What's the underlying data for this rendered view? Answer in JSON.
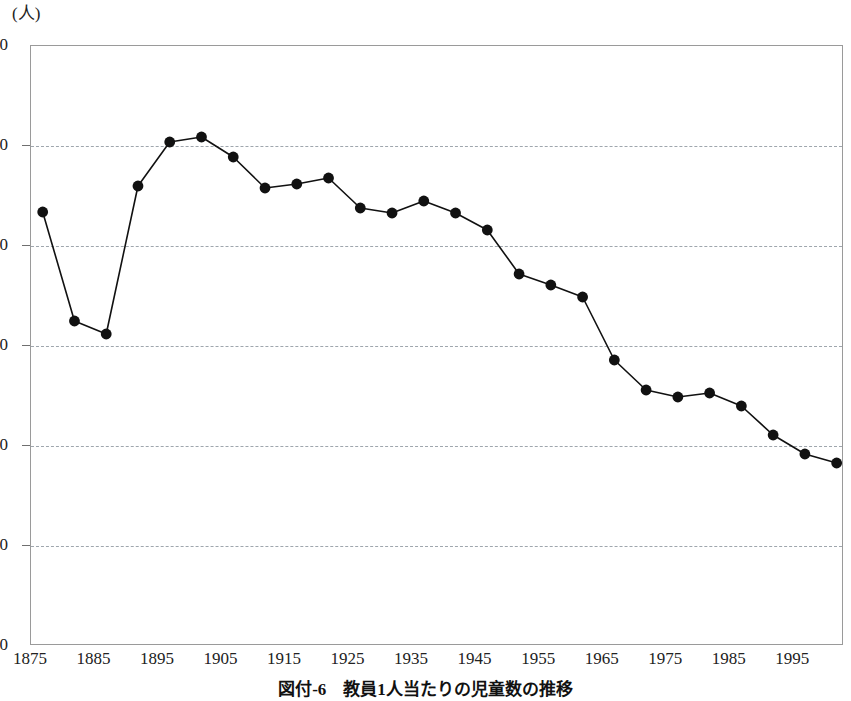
{
  "figure": {
    "caption": "図付-6　教員1人当たりの児童数の推移",
    "unit_label": "(人)"
  },
  "chart_data": {
    "type": "line",
    "title": "図付-6　教員1人当たりの児童数の推移",
    "xlabel": "",
    "ylabel": "(人)",
    "unit": "人",
    "xlim": [
      1875,
      2003
    ],
    "ylim": [
      0,
      60
    ],
    "yticks": [
      0,
      10,
      20,
      30,
      40,
      50,
      60
    ],
    "ytick_labels": [
      "0",
      "10",
      "20",
      "30",
      "40",
      "50",
      "60"
    ],
    "xticks": [
      1875,
      1885,
      1895,
      1905,
      1915,
      1925,
      1935,
      1945,
      1955,
      1965,
      1975,
      1985,
      1995
    ],
    "xtick_labels": [
      "1875",
      "1885",
      "1895",
      "1905",
      "1915",
      "1925",
      "1935",
      "1945",
      "1955",
      "1965",
      "1975",
      "1985",
      "1995"
    ],
    "grid": "horizontal-dashed",
    "legend": "none",
    "marker": "filled-circle",
    "line_color": "#111111",
    "marker_color": "#111111",
    "grid_color": "#9fa6ad",
    "x": [
      1877,
      1882,
      1887,
      1892,
      1897,
      1902,
      1907,
      1912,
      1917,
      1922,
      1927,
      1932,
      1937,
      1942,
      1947,
      1952,
      1957,
      1962,
      1967,
      1972,
      1977,
      1982,
      1987,
      1992,
      1997,
      2002
    ],
    "values": [
      43.3,
      32.4,
      31.1,
      45.9,
      50.3,
      50.8,
      48.8,
      45.7,
      46.1,
      46.7,
      43.7,
      43.2,
      44.4,
      43.2,
      41.5,
      37.1,
      36.0,
      34.8,
      28.5,
      25.5,
      24.8,
      25.2,
      23.9,
      21.0,
      19.1,
      18.2
    ]
  }
}
